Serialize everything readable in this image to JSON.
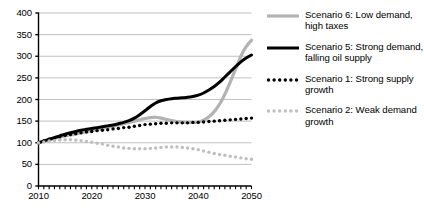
{
  "chart_data": {
    "type": "line",
    "title": "",
    "xlabel": "",
    "ylabel": "",
    "xlim": [
      2010,
      2050
    ],
    "ylim": [
      0,
      400
    ],
    "ytick_step": 50,
    "grid": true,
    "legend_position": "right",
    "xticks": [
      "2010",
      "2020",
      "2030",
      "2040",
      "2050"
    ],
    "yticks": [
      "0",
      "50",
      "100",
      "150",
      "200",
      "250",
      "300",
      "350",
      "400"
    ],
    "x": [
      2010,
      2011,
      2012,
      2013,
      2014,
      2015,
      2016,
      2017,
      2018,
      2019,
      2020,
      2021,
      2022,
      2023,
      2024,
      2025,
      2026,
      2027,
      2028,
      2029,
      2030,
      2031,
      2032,
      2033,
      2034,
      2035,
      2036,
      2037,
      2038,
      2039,
      2040,
      2041,
      2042,
      2043,
      2044,
      2045,
      2046,
      2047,
      2048,
      2049,
      2050
    ],
    "series": [
      {
        "name": "Scenario 6: Low demand, high taxes",
        "style": "solid",
        "color": "#b3b3b3",
        "width": 3.2,
        "values": [
          100,
          103,
          106,
          110,
          113,
          116,
          118,
          120,
          123,
          126,
          128,
          131,
          133,
          136,
          138,
          141,
          144,
          147,
          150,
          153,
          156,
          158,
          159,
          157,
          154,
          151,
          149,
          148,
          147,
          147,
          148,
          152,
          160,
          172,
          189,
          212,
          240,
          270,
          300,
          322,
          337
        ]
      },
      {
        "name": "Scenario 5: Strong demand, falling oil supply",
        "style": "solid",
        "color": "#000000",
        "width": 3.0,
        "values": [
          100,
          104,
          108,
          112,
          116,
          120,
          123,
          126,
          129,
          131,
          133,
          135,
          137,
          139,
          141,
          144,
          147,
          151,
          157,
          165,
          174,
          184,
          192,
          197,
          200,
          202,
          203,
          204,
          205,
          207,
          210,
          215,
          222,
          230,
          240,
          252,
          264,
          276,
          287,
          296,
          303
        ]
      },
      {
        "name": "Scenario 1: Strong supply growth",
        "style": "dotted",
        "color": "#000000",
        "width": 3.4,
        "values": [
          100,
          104,
          108,
          111,
          114,
          117,
          119,
          121,
          123,
          125,
          126,
          128,
          129,
          130,
          132,
          133,
          135,
          136,
          138,
          140,
          142,
          143,
          144,
          145,
          145,
          146,
          146,
          146,
          146,
          147,
          147,
          148,
          149,
          150,
          151,
          152,
          153,
          154,
          155,
          156,
          157
        ]
      },
      {
        "name": "Scenario 2: Weak demand growth",
        "style": "dotted",
        "color": "#bfbfbf",
        "width": 3.4,
        "values": [
          100,
          102,
          104,
          105,
          106,
          107,
          107,
          106,
          105,
          103,
          101,
          99,
          97,
          94,
          92,
          90,
          88,
          87,
          86,
          86,
          86,
          87,
          88,
          89,
          90,
          90,
          90,
          89,
          88,
          86,
          84,
          81,
          78,
          75,
          73,
          71,
          69,
          67,
          65,
          63,
          62
        ]
      }
    ]
  },
  "legend": {
    "items": [
      {
        "label": "Scenario 6: Low demand, high taxes",
        "style": "solid",
        "color": "#b3b3b3"
      },
      {
        "label": "Scenario 5: Strong demand, falling oil supply",
        "style": "solid",
        "color": "#000000"
      },
      {
        "label": "Scenario 1: Strong supply growth",
        "style": "dotted",
        "color": "#000000"
      },
      {
        "label": "Scenario 2: Weak demand growth",
        "style": "dotted",
        "color": "#bfbfbf"
      }
    ]
  },
  "axes": {
    "grid_color": "#b0b0b0",
    "axis_color": "#000000"
  }
}
